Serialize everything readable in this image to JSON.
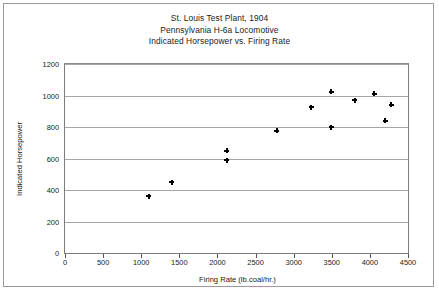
{
  "chart_data": {
    "type": "scatter",
    "title": "St. Louis Test Plant, 1904",
    "subtitle": "Pennsylvania H-6a Locomotive",
    "subtitle2": "Indicated Horsepower vs. Firing Rate",
    "xlabel": "Firing Rate (lb.coal/hr.)",
    "ylabel": "Indicated Horsepower",
    "xlim": [
      0,
      4500
    ],
    "ylim": [
      0,
      1200
    ],
    "xticks": [
      0,
      500,
      1000,
      1500,
      2000,
      2500,
      3000,
      3500,
      4000,
      4500
    ],
    "yticks": [
      0,
      200,
      400,
      600,
      800,
      1000,
      1200
    ],
    "grid": "horizontal",
    "legend": "none",
    "marker": "plus-filled",
    "marker_color": "#000000",
    "points": [
      {
        "x": 1100,
        "y": 360
      },
      {
        "x": 1400,
        "y": 450
      },
      {
        "x": 2120,
        "y": 650
      },
      {
        "x": 2120,
        "y": 590
      },
      {
        "x": 2780,
        "y": 775
      },
      {
        "x": 3230,
        "y": 925
      },
      {
        "x": 3490,
        "y": 1025
      },
      {
        "x": 3490,
        "y": 800
      },
      {
        "x": 3800,
        "y": 970
      },
      {
        "x": 4060,
        "y": 1010
      },
      {
        "x": 4200,
        "y": 840
      },
      {
        "x": 4280,
        "y": 940
      }
    ]
  }
}
